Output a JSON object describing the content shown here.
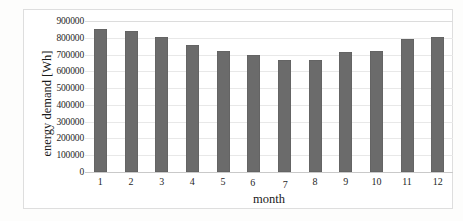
{
  "chart_data": {
    "type": "bar",
    "title": "",
    "xlabel": "month",
    "ylabel": "energy demand  [Wh]",
    "categories": [
      "1",
      "2",
      "3",
      "4",
      "5",
      "6",
      "7",
      "8",
      "9",
      "10",
      "11",
      "12"
    ],
    "values": [
      850000,
      840000,
      805000,
      760000,
      720000,
      700000,
      670000,
      670000,
      715000,
      720000,
      790000,
      805000
    ],
    "ylim": [
      0,
      900000
    ],
    "ytick_labels": [
      "900000",
      "800000",
      "700000",
      "600000",
      "500000",
      "400000",
      "300000",
      "200000",
      "100000",
      "0"
    ],
    "ytick_values": [
      900000,
      800000,
      700000,
      600000,
      500000,
      400000,
      300000,
      200000,
      100000,
      0
    ],
    "grid": true,
    "legend": "none",
    "series": [
      {
        "name": "energy demand",
        "color": "#6b6b6b",
        "values": [
          850000,
          840000,
          805000,
          760000,
          720000,
          700000,
          670000,
          670000,
          715000,
          720000,
          790000,
          805000
        ]
      }
    ]
  },
  "colors": {
    "bar": "#6b6b6b",
    "grid": "#e8e8e8",
    "axis": "#c9c9c9",
    "text": "#1a1a1a",
    "background": "#ffffff",
    "frame": "#dedede"
  }
}
